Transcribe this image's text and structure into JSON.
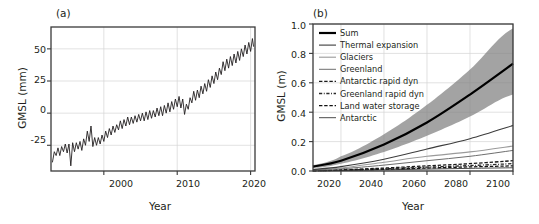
{
  "figure": {
    "panels": [
      {
        "id": "a",
        "label": "(a)",
        "xlabel": "Year",
        "ylabel": "GMSL (mm)"
      },
      {
        "id": "b",
        "label": "(b)",
        "xlabel": "Year",
        "ylabel": "GMSL (m)"
      }
    ]
  },
  "chart_data": [
    {
      "id": "panel-a",
      "type": "line",
      "title": "(a)",
      "xlabel": "Year",
      "ylabel": "GMSL (mm)",
      "xlim": [
        1992.8,
        2020.6
      ],
      "ylim": [
        -45,
        67
      ],
      "xticks": [
        2000,
        2010,
        2020
      ],
      "xticklabels": [
        "2000",
        "2010",
        "2020"
      ],
      "yticks": [
        -25,
        0,
        25,
        50
      ],
      "yticklabels": [
        "-25",
        "0",
        "25",
        "50"
      ],
      "grid": true,
      "series": [
        {
          "name": "Observed GMSL (satellite altimetry)",
          "color": "#231f20",
          "linewidth": 0.9,
          "description": "Monthly global mean sea level with strong seasonal cycle superimposed on a near-linear rise of about 3.3 mm/yr",
          "trend_mm_per_year": 3.3,
          "seasonal_amplitude_mm": 6,
          "x": [
            1993.0,
            1993.25,
            1993.5,
            1993.75,
            1994.0,
            1994.25,
            1994.5,
            1994.75,
            1995.0,
            1995.25,
            1995.5,
            1995.75,
            1996.0,
            1996.25,
            1996.5,
            1996.75,
            1997.0,
            1997.25,
            1997.5,
            1997.75,
            1998.0,
            1998.25,
            1998.5,
            1998.75,
            1999.0,
            1999.25,
            1999.5,
            1999.75,
            2000.0,
            2000.25,
            2000.5,
            2000.75,
            2001.0,
            2001.25,
            2001.5,
            2001.75,
            2002.0,
            2002.25,
            2002.5,
            2002.75,
            2003.0,
            2003.25,
            2003.5,
            2003.75,
            2004.0,
            2004.25,
            2004.5,
            2004.75,
            2005.0,
            2005.25,
            2005.5,
            2005.75,
            2006.0,
            2006.25,
            2006.5,
            2006.75,
            2007.0,
            2007.25,
            2007.5,
            2007.75,
            2008.0,
            2008.25,
            2008.5,
            2008.75,
            2009.0,
            2009.25,
            2009.5,
            2009.75,
            2010.0,
            2010.25,
            2010.5,
            2010.75,
            2011.0,
            2011.25,
            2011.5,
            2011.75,
            2012.0,
            2012.25,
            2012.5,
            2012.75,
            2013.0,
            2013.25,
            2013.5,
            2013.75,
            2014.0,
            2014.25,
            2014.5,
            2014.75,
            2015.0,
            2015.25,
            2015.5,
            2015.75,
            2016.0,
            2016.25,
            2016.5,
            2016.75,
            2017.0,
            2017.25,
            2017.5,
            2017.75,
            2018.0,
            2018.25,
            2018.5,
            2018.75,
            2019.0,
            2019.25,
            2019.5,
            2019.75,
            2020.0,
            2020.25,
            2020.4
          ],
          "y": [
            -38,
            -30,
            -33,
            -27,
            -33,
            -26,
            -30,
            -24,
            -31,
            -24,
            -41,
            -23,
            -30,
            -23,
            -28,
            -22,
            -29,
            -20,
            -25,
            -14,
            -22,
            -10,
            -26,
            -19,
            -25,
            -19,
            -24,
            -17,
            -22,
            -14,
            -19,
            -12,
            -17,
            -10,
            -15,
            -9,
            -13,
            -6,
            -12,
            -5,
            -10,
            -3,
            -9,
            -3,
            -8,
            -2,
            -7,
            -1,
            -6,
            0,
            -6,
            1,
            -5,
            2,
            -4,
            2,
            -3,
            4,
            -2,
            5,
            -2,
            6,
            0,
            8,
            1,
            9,
            3,
            11,
            5,
            13,
            4,
            11,
            -1,
            7,
            3,
            12,
            8,
            17,
            10,
            18,
            12,
            21,
            15,
            23,
            17,
            26,
            20,
            29,
            23,
            32,
            26,
            35,
            30,
            40,
            33,
            42,
            35,
            44,
            37,
            46,
            39,
            48,
            41,
            50,
            44,
            53,
            46,
            55,
            48,
            58,
            52
          ]
        }
      ]
    },
    {
      "id": "panel-b",
      "type": "line",
      "title": "(b)",
      "xlabel": "Year",
      "ylabel": "GMSL (m)",
      "xlim": [
        2007,
        2100
      ],
      "ylim": [
        0.0,
        1.0
      ],
      "xticks": [
        2020,
        2040,
        2060,
        2080,
        2100
      ],
      "xticklabels": [
        "2020",
        "2040",
        "2060",
        "2080",
        "2100"
      ],
      "yticks": [
        0.0,
        0.2,
        0.4,
        0.6,
        0.8,
        1.0
      ],
      "yticklabels": [
        "0.0",
        "0.2",
        "0.4",
        "0.6",
        "0.8",
        "1.0"
      ],
      "grid": true,
      "legend_position": "upper-left",
      "x": [
        2007,
        2020,
        2040,
        2060,
        2080,
        2100
      ],
      "uncertainty_band": {
        "name": "Sum likely range",
        "color": "#808080",
        "lower": [
          0.02,
          0.05,
          0.13,
          0.24,
          0.37,
          0.52
        ],
        "upper": [
          0.04,
          0.1,
          0.25,
          0.45,
          0.69,
          0.97
        ]
      },
      "series": [
        {
          "name": "Sum",
          "color": "#000000",
          "linewidth": 2.2,
          "linestyle": "solid",
          "values": [
            0.03,
            0.07,
            0.18,
            0.33,
            0.52,
            0.73
          ]
        },
        {
          "name": "Thermal expansion",
          "color": "#3c3c3c",
          "linewidth": 1.1,
          "linestyle": "solid",
          "values": [
            0.01,
            0.03,
            0.08,
            0.15,
            0.22,
            0.31
          ]
        },
        {
          "name": "Glaciers",
          "color": "#9a9a9a",
          "linewidth": 1.1,
          "linestyle": "solid",
          "values": [
            0.01,
            0.02,
            0.06,
            0.1,
            0.13,
            0.17
          ]
        },
        {
          "name": "Greenland",
          "color": "#6e6e6e",
          "linewidth": 1.0,
          "linestyle": "solid",
          "values": [
            0.005,
            0.015,
            0.04,
            0.07,
            0.1,
            0.14
          ]
        },
        {
          "name": "Antarctic rapid dyn",
          "color": "#1a1a1a",
          "linewidth": 1.3,
          "linestyle": "dashed",
          "values": [
            0.003,
            0.008,
            0.02,
            0.035,
            0.05,
            0.07
          ]
        },
        {
          "name": "Greenland rapid dyn",
          "color": "#2a2a2a",
          "linewidth": 1.3,
          "linestyle": "dashdot",
          "values": [
            0.002,
            0.006,
            0.015,
            0.026,
            0.037,
            0.05
          ]
        },
        {
          "name": "Land water storage",
          "color": "#111111",
          "linewidth": 1.3,
          "linestyle": "dashed",
          "values": [
            0.002,
            0.005,
            0.012,
            0.02,
            0.028,
            0.035
          ]
        },
        {
          "name": "Antarctic",
          "color": "#4a4a4a",
          "linewidth": 1.0,
          "linestyle": "solid",
          "values": [
            0.001,
            0.003,
            0.008,
            0.013,
            0.018,
            0.022
          ]
        }
      ]
    }
  ]
}
